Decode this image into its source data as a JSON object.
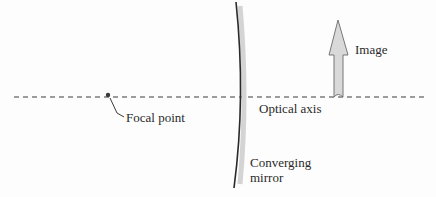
{
  "diagram": {
    "labels": {
      "image": "Image",
      "optical_axis": "Optical axis",
      "focal_point": "Focal point",
      "mirror_line1": "Converging",
      "mirror_line2": "mirror"
    },
    "colors": {
      "line": "#2a2a2a",
      "mirror_shade": "#d4d4d4",
      "arrow_fill": "#d9d9d9",
      "arrow_stroke": "#777777"
    }
  }
}
